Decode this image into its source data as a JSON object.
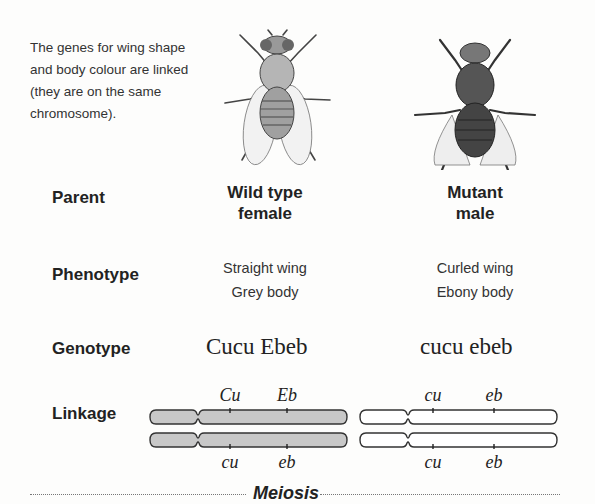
{
  "intro_text": "The genes for wing shape and body colour are linked (they are on the same chromosome).",
  "rows": {
    "parent": "Parent",
    "phenotype": "Phenotype",
    "genotype": "Genotype",
    "linkage": "Linkage"
  },
  "wild_type": {
    "icon": "fruit-fly-wild-type-icon",
    "parent_line1": "Wild type",
    "parent_line2": "female",
    "phenotype_line1": "Straight wing",
    "phenotype_line2": "Grey body",
    "genotype": "Cucu Ebeb",
    "chromosome_fill": "#c8c8c8",
    "top_alleles": [
      "Cu",
      "Eb"
    ],
    "bottom_alleles": [
      "cu",
      "eb"
    ]
  },
  "mutant": {
    "icon": "fruit-fly-mutant-icon",
    "parent_line1": "Mutant",
    "parent_line2": "male",
    "phenotype_line1": "Curled wing",
    "phenotype_line2": "Ebony body",
    "genotype": "cucu ebeb",
    "chromosome_fill": "#ffffff",
    "top_alleles": [
      "cu",
      "eb"
    ],
    "bottom_alleles": [
      "cu",
      "eb"
    ]
  },
  "footer_label": "Meiosis"
}
